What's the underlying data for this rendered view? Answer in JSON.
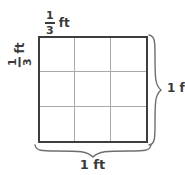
{
  "figure": {
    "type": "area-model-diagram",
    "shape": "square",
    "grid": {
      "rows": 3,
      "columns": 3,
      "cells": 9,
      "border_color": "#3d3d3d",
      "gridline_color": "#a9a9a9",
      "fill_color": "#ffffff"
    },
    "labels": {
      "top": {
        "name": "cell-width",
        "numerator": "1",
        "denominator": "3",
        "unit": "ft",
        "text": "1/3 ft"
      },
      "left": {
        "name": "cell-height",
        "numerator": "1",
        "denominator": "3",
        "unit": "ft",
        "text": "1/3 ft",
        "rotation": "-90"
      },
      "right": {
        "name": "total-height",
        "value": "1",
        "unit": "ft",
        "text": "1 ft"
      },
      "bottom": {
        "name": "total-width",
        "value": "1",
        "unit": "ft",
        "text": "1 ft"
      }
    },
    "braces": {
      "right": "vertical-curly-brace",
      "bottom": "horizontal-curly-brace"
    }
  }
}
